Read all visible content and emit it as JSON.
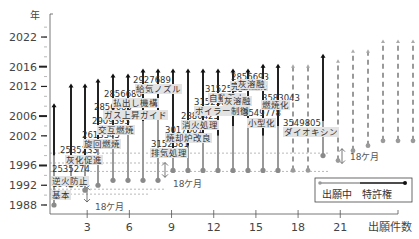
{
  "chart_data": {
    "type": "timeline-stem",
    "title": "",
    "xlabel": "出願件数",
    "ylabel": "年",
    "y_ticks": [
      1988,
      1992,
      1996,
      2002,
      2006,
      2012,
      2016,
      2022
    ],
    "x_ticks": [
      3,
      6,
      9,
      12,
      15,
      18,
      21
    ],
    "ylim": [
      1987,
      2025
    ],
    "xlim": [
      0,
      25
    ],
    "legend": {
      "pending": "出願中",
      "granted": "特許権"
    },
    "annotations": [
      "18ケ月",
      "18ケ月",
      "18ケ月"
    ],
    "series": [
      {
        "x": 1,
        "filed": 1988,
        "granted": 1998,
        "expiry": 2008,
        "number": "1943494",
        "label": "基本",
        "status": "granted"
      },
      {
        "x": 2,
        "filed": 1992,
        "granted": 1998,
        "expiry": 2012,
        "number": "2535274",
        "label": "逆火防止",
        "status": "granted"
      },
      {
        "x": 3,
        "filed": 1991,
        "granted": 1997,
        "expiry": 2012,
        "number": "2535233",
        "label": "灰化促進",
        "status": "granted"
      },
      {
        "x": 4,
        "filed": 1992,
        "granted": 2000,
        "expiry": 2013,
        "number": "2613345",
        "label": "旋回燃焼",
        "status": "granted"
      },
      {
        "x": 5,
        "filed": 1993,
        "granted": 2003,
        "expiry": 2014,
        "number": "2909393",
        "label": "交互燃焼",
        "status": "granted"
      },
      {
        "x": 6,
        "filed": 1993,
        "granted": 2004,
        "expiry": 2014,
        "number": "2856685",
        "label": "ガス上昇ガイド",
        "status": "granted"
      },
      {
        "x": 7,
        "filed": 1993,
        "granted": 2005,
        "expiry": 2015,
        "number": "2856686",
        "label": "払出し機構",
        "status": "granted"
      },
      {
        "x": 8,
        "filed": 1993,
        "granted": 2007,
        "expiry": 2015,
        "number": "2927689",
        "label": "給気ノズル",
        "status": "granted"
      },
      {
        "x": 9,
        "filed": 1995,
        "granted": 1999,
        "expiry": 2015,
        "number": "3152581",
        "label": "排気処理",
        "status": "granted"
      },
      {
        "x": 10,
        "filed": 1995,
        "granted": 2000,
        "expiry": 2015,
        "number": "3017661",
        "label": "焼却炉改良",
        "status": "granted"
      },
      {
        "x": 11,
        "filed": 1995,
        "granted": 2001,
        "expiry": 2015,
        "number": "2880425",
        "label": "消火処理",
        "status": "granted"
      },
      {
        "x": 12,
        "filed": 1995,
        "granted": 2002,
        "expiry": 2015,
        "number": "3152586",
        "label": "ボイラー制御",
        "status": "granted"
      },
      {
        "x": 13,
        "filed": 1995,
        "granted": 2004,
        "expiry": 2015,
        "number": "3152588",
        "label": "自動着火",
        "status": "granted"
      },
      {
        "x": 14,
        "filed": 1995,
        "granted": 2005,
        "expiry": 2015,
        "number": "2856693",
        "label": "完全燃焼",
        "status": "granted"
      },
      {
        "x": 15,
        "filed": 1995,
        "granted": 2002,
        "expiry": 2016,
        "number": "3549778",
        "label": "小型化",
        "status": "granted"
      },
      {
        "x": 16,
        "filed": 1995,
        "granted": 2004,
        "expiry": 2016,
        "number": "3583043",
        "label": "燃焼化",
        "status": "granted"
      },
      {
        "x": 17,
        "filed": 1995,
        "granted": null,
        "expiry": 2016,
        "number": "",
        "label": "灰溶融",
        "status": "pending"
      },
      {
        "x": 18,
        "filed": 1995,
        "granted": null,
        "expiry": 2016,
        "number": "",
        "label": "灰溶融",
        "status": "pending"
      },
      {
        "x": 19,
        "filed": 1998,
        "granted": 2005,
        "expiry": 2018,
        "number": "3549805",
        "label": "ダイオキシン",
        "status": "granted"
      },
      {
        "x": 20,
        "filed": 1997,
        "granted": null,
        "expiry": 2017,
        "number": "",
        "label": "",
        "status": "pending"
      },
      {
        "x": 21,
        "filed": 1999,
        "granted": null,
        "expiry": 2019,
        "number": "",
        "label": "",
        "status": "pending"
      },
      {
        "x": 22,
        "filed": 2000,
        "granted": null,
        "expiry": 2019,
        "number": "",
        "label": "",
        "status": "pending"
      },
      {
        "x": 23,
        "filed": 2001,
        "granted": null,
        "expiry": 2021,
        "number": "",
        "label": "",
        "status": "pending"
      },
      {
        "x": 24,
        "filed": 2001,
        "granted": null,
        "expiry": 2021,
        "number": "",
        "label": "",
        "status": "pending"
      },
      {
        "x": 25,
        "filed": 2001,
        "granted": null,
        "expiry": 2021,
        "number": "",
        "label": "",
        "status": "pending"
      }
    ]
  },
  "axis": {
    "year_label": "年",
    "count_label": "出願件数"
  },
  "legend": {
    "pending": "出願中",
    "granted": "特許権"
  },
  "annotation": "18ケ月"
}
